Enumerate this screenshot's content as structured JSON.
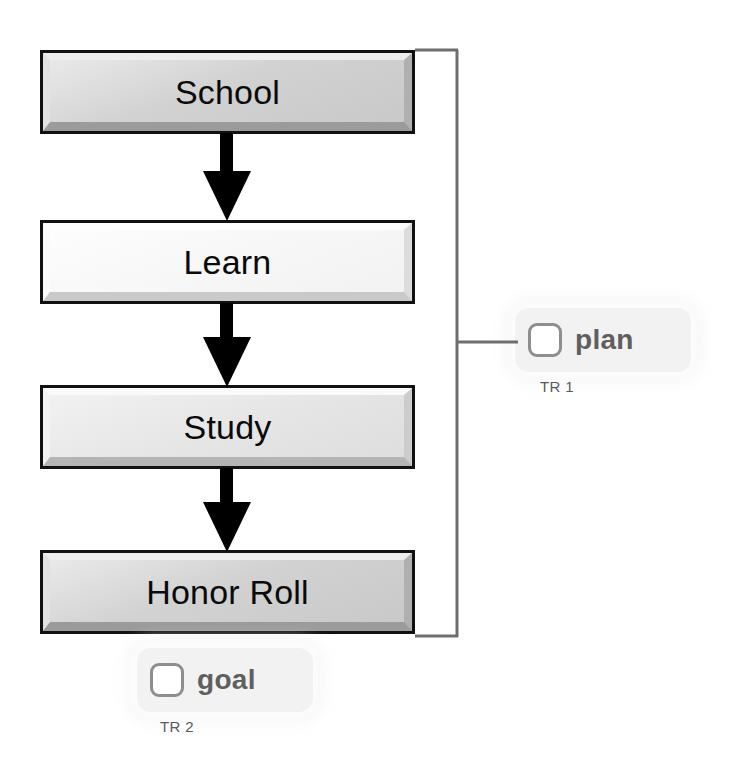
{
  "diagram": {
    "type": "flowchart",
    "orientation": "vertical",
    "title": "",
    "nodes": [
      {
        "id": "school",
        "label": "School",
        "shade": "dark",
        "x": 40,
        "y": 50,
        "w": 375,
        "h": 84
      },
      {
        "id": "learn",
        "label": "Learn",
        "shade": "light",
        "x": 40,
        "y": 220,
        "w": 375,
        "h": 84
      },
      {
        "id": "study",
        "label": "Study",
        "shade": "mid",
        "x": 40,
        "y": 385,
        "w": 375,
        "h": 84
      },
      {
        "id": "honor_roll",
        "label": "Honor Roll",
        "shade": "dark",
        "x": 40,
        "y": 550,
        "w": 375,
        "h": 84
      }
    ],
    "edges": [
      {
        "from": "school",
        "to": "learn",
        "kind": "arrow-down"
      },
      {
        "from": "learn",
        "to": "study",
        "kind": "arrow-down"
      },
      {
        "from": "study",
        "to": "honor_roll",
        "kind": "arrow-down"
      }
    ],
    "brackets": [
      {
        "id": "plan-bracket",
        "covers": [
          "school",
          "learn",
          "study",
          "honor_roll"
        ],
        "side": "right",
        "connects_to": "plan"
      }
    ],
    "callouts": [
      {
        "id": "plan",
        "label": "plan",
        "caption": "TR 1",
        "checkbox": "unchecked",
        "icon": "checkbox-icon",
        "x": 515,
        "y": 308,
        "w": 176,
        "h": 64,
        "caption_x": 540,
        "caption_y": 378
      },
      {
        "id": "goal",
        "label": "goal",
        "caption": "TR 2",
        "checkbox": "unchecked",
        "icon": "checkbox-icon",
        "x": 137,
        "y": 648,
        "w": 176,
        "h": 64,
        "caption_x": 160,
        "caption_y": 718
      }
    ]
  },
  "colors": {
    "background": "#ffffff",
    "node_border": "#111111",
    "node_fill_dark": "#d2d2d2",
    "node_fill_light": "#f7f7f7",
    "node_fill_mid": "#e6e6e6",
    "node_text": "#0a0a0a",
    "arrow": "#000000",
    "bracket": "#6e6e6e",
    "badge_fill": "#f2f2f2",
    "badge_text": "#5f5f5f",
    "checkbox_border": "#8e8e8e",
    "checkbox_fill": "#ffffff",
    "caption_text": "#5a5a5a"
  }
}
